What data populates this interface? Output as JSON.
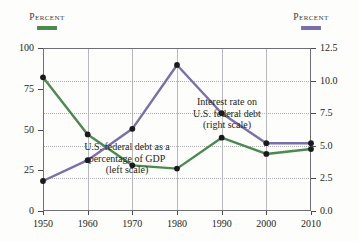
{
  "header": {
    "left_label": "Percent",
    "right_label": "Percent",
    "left_color": "#4a8a4f",
    "right_color": "#7a6fa8"
  },
  "annotations": {
    "interest": {
      "line1": "Interest rate on",
      "line2": "U.S. federal debt",
      "line3": "(right scale)"
    },
    "debt": {
      "line1": "U.S. federal debt as a",
      "line2": "percentage of GDP",
      "line3": "(left scale)"
    }
  },
  "axes": {
    "left_ticks": [
      "100",
      "75",
      "50",
      "25",
      "0"
    ],
    "right_ticks": [
      "12.5",
      "10.0",
      "7.5",
      "5.0",
      "2.5",
      "0.0"
    ],
    "x_ticks": [
      "1950",
      "1960",
      "1970",
      "1980",
      "1990",
      "2000",
      "2010"
    ]
  },
  "chart_data": {
    "type": "line",
    "title": "",
    "xlabel": "",
    "ylabel": "Percent",
    "y2label": "Percent",
    "x": [
      1950,
      1960,
      1970,
      1980,
      1990,
      2000,
      2010
    ],
    "grid": true,
    "legend_position": "none",
    "ylim": [
      0,
      100
    ],
    "y2lim": [
      0.0,
      12.5
    ],
    "yticks": [
      0,
      25,
      50,
      75,
      100
    ],
    "y2ticks": [
      0.0,
      2.5,
      5.0,
      7.5,
      10.0,
      12.5
    ],
    "series": [
      {
        "name": "U.S. federal debt as a percentage of GDP",
        "axis": "left",
        "color": "#4a8a4f",
        "marker": "circle",
        "values": [
          82,
          47,
          28,
          26,
          45,
          35,
          38
        ]
      },
      {
        "name": "Interest rate on U.S. federal debt",
        "axis": "right",
        "color": "#7a6fa8",
        "marker": "circle",
        "values": [
          2.3,
          3.9,
          6.3,
          11.2,
          7.5,
          5.2,
          5.2
        ]
      }
    ]
  }
}
